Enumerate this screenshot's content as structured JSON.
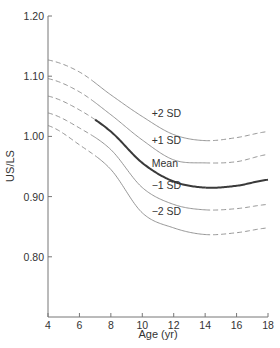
{
  "chart_data": {
    "type": "line",
    "title": "",
    "xlabel": "Age (yr)",
    "ylabel": "US/LS",
    "xlim": [
      4,
      18
    ],
    "ylim": [
      0.7,
      1.2
    ],
    "x_ticks": [
      4,
      6,
      8,
      10,
      12,
      14,
      16,
      18
    ],
    "x_tick_labels": [
      "4",
      "6",
      "8",
      "10",
      "12",
      "14",
      "16",
      "18"
    ],
    "y_ticks": [
      0.8,
      0.9,
      1.0,
      1.1,
      1.2
    ],
    "y_tick_labels": [
      "0.80",
      "0.90",
      "1.00",
      "1.10",
      "1.20"
    ],
    "grid": false,
    "legend": "inline labels",
    "x": [
      4,
      6,
      8,
      10,
      12,
      14,
      16,
      18
    ],
    "solid_range": [
      7,
      14
    ],
    "series": [
      {
        "name": "+2 SD",
        "label": "+2 SD",
        "style": "thin",
        "values": [
          1.127,
          1.107,
          1.069,
          1.033,
          1.003,
          0.993,
          0.998,
          1.008
        ]
      },
      {
        "name": "+1 SD",
        "label": "+1 SD",
        "style": "thin",
        "values": [
          1.096,
          1.074,
          1.036,
          0.994,
          0.961,
          0.956,
          0.958,
          0.97
        ]
      },
      {
        "name": "Mean",
        "label": "Mean",
        "style": "thick",
        "values": [
          1.067,
          1.044,
          1.008,
          0.956,
          0.925,
          0.915,
          0.918,
          0.928
        ]
      },
      {
        "name": "-1 SD",
        "label": "−1 SD",
        "style": "thin",
        "values": [
          1.039,
          1.014,
          0.978,
          0.915,
          0.887,
          0.878,
          0.88,
          0.887
        ]
      },
      {
        "name": "-2 SD",
        "label": "−2 SD",
        "style": "thin",
        "values": [
          1.018,
          0.986,
          0.945,
          0.873,
          0.848,
          0.837,
          0.84,
          0.848
        ]
      }
    ],
    "label_positions": [
      {
        "series": "+2 SD",
        "x": 10.6,
        "y": 1.032
      },
      {
        "series": "+1 SD",
        "x": 10.6,
        "y": 0.988
      },
      {
        "series": "Mean",
        "x": 10.6,
        "y": 0.95
      },
      {
        "series": "-1 SD",
        "x": 10.6,
        "y": 0.912
      },
      {
        "series": "-2 SD",
        "x": 10.6,
        "y": 0.869
      }
    ]
  }
}
